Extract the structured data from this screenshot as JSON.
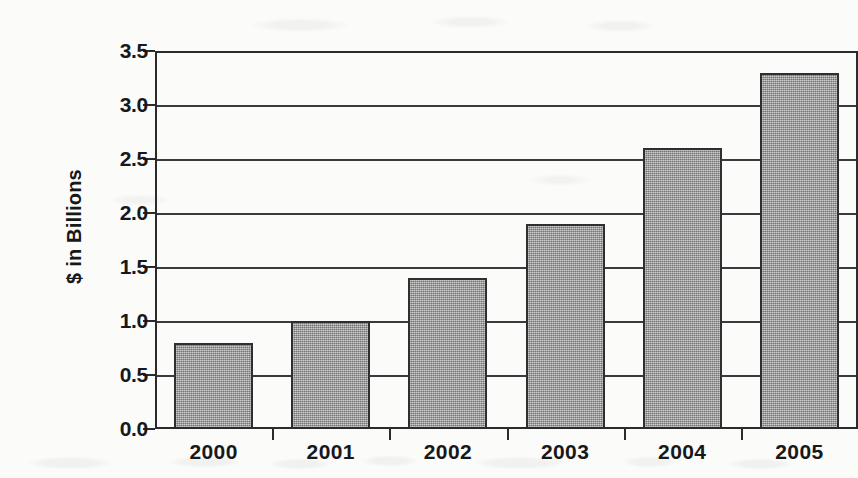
{
  "chart_data": {
    "type": "bar",
    "title": "",
    "subtitle": "",
    "xlabel": "",
    "ylabel": "$ in Billions",
    "categories": [
      "2000",
      "2001",
      "2002",
      "2003",
      "2004",
      "2005"
    ],
    "values": [
      0.8,
      1.0,
      1.4,
      1.9,
      2.6,
      3.3
    ],
    "series": [
      {
        "name": "",
        "values": [
          0.8,
          1.0,
          1.4,
          1.9,
          2.6,
          3.3
        ]
      }
    ],
    "ylim": [
      0.0,
      3.5
    ],
    "ytick_values": [
      0.0,
      0.5,
      1.0,
      1.5,
      2.0,
      2.5,
      3.0,
      3.5
    ],
    "ytick_labels": [
      "0.0",
      "0.5",
      "1.0",
      "1.5",
      "2.0",
      "2.5",
      "3.0",
      "3.5"
    ],
    "ytick_step": 0.5,
    "grid": "horizontal",
    "legend": "none",
    "legend_position": "none",
    "annotations": [],
    "bar_color": "#969696",
    "bar_edge_color": "#2f2f31",
    "axis_color": "#2b2b2d",
    "grid_color": "#3a3a3c",
    "background_color": "#fbfbfa",
    "text_color": "#17181a"
  }
}
